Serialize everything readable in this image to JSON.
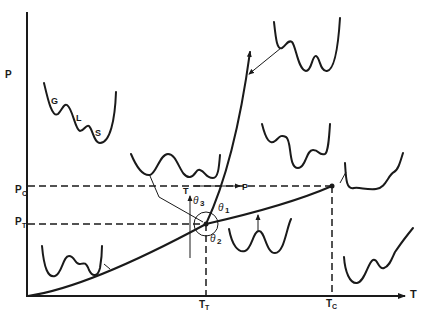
{
  "diagram": {
    "type": "phase-diagram",
    "axes": {
      "x_label": "T",
      "y_label": "P"
    },
    "y_ticks": [
      {
        "id": "pc",
        "main": "P",
        "sub": "C"
      },
      {
        "id": "pt",
        "main": "P",
        "sub": "T"
      }
    ],
    "x_ticks": [
      {
        "id": "tt",
        "main": "T",
        "sub": "T"
      },
      {
        "id": "tc",
        "main": "T",
        "sub": "C"
      }
    ],
    "potential_labels": {
      "gas": "G",
      "liquid": "L",
      "solid": "S"
    },
    "triple_point_inset": {
      "vertical_axis": "T",
      "horizontal_axis": "P",
      "angles": [
        {
          "name": "theta",
          "sub": "1"
        },
        {
          "name": "theta",
          "sub": "2"
        },
        {
          "name": "theta",
          "sub": "3"
        }
      ]
    },
    "points": [
      "triple-point",
      "critical-point"
    ],
    "curves": [
      "sublimation-curve",
      "vaporization-curve",
      "melting-curve"
    ]
  }
}
